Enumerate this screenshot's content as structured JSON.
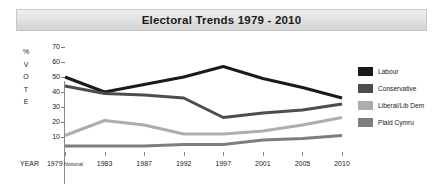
{
  "header": {
    "title": "Electoral Trends 1979 - 2010"
  },
  "axes": {
    "y_axis_caption_chars": [
      "%",
      "V",
      "O",
      "T",
      "E"
    ],
    "y_ticks": [
      70,
      60,
      50,
      40,
      30,
      20,
      10
    ],
    "x_axis_caption": "YEAR"
  },
  "legend": {
    "items": [
      {
        "label": "Labour",
        "color": "#1a1a1a"
      },
      {
        "label": "Conservative",
        "color": "#4d4d4d"
      },
      {
        "label": "Liberal/Lib Dem",
        "color": "#adadad"
      },
      {
        "label": "Plaid Cymru",
        "color": "#7d7d7d"
      }
    ]
  },
  "chart_data": {
    "type": "line",
    "title": "Electoral Trends 1979 - 2010",
    "xlabel": "YEAR",
    "ylabel": "% VOTE",
    "ylim": [
      0,
      70
    ],
    "grid": false,
    "legend_position": "right",
    "categories": [
      "1979 Notional",
      "1983",
      "1987",
      "1992",
      "1997",
      "2001",
      "2005",
      "2010"
    ],
    "x_tick_labels": [
      {
        "year": "1979",
        "note": "Notional"
      },
      {
        "year": "1983",
        "note": ""
      },
      {
        "year": "1987",
        "note": ""
      },
      {
        "year": "1992",
        "note": ""
      },
      {
        "year": "1997",
        "note": ""
      },
      {
        "year": "2001",
        "note": ""
      },
      {
        "year": "2005",
        "note": ""
      },
      {
        "year": "2010",
        "note": ""
      }
    ],
    "series": [
      {
        "name": "Labour",
        "color": "#1a1a1a",
        "values": [
          50,
          40,
          45,
          50,
          57,
          49,
          43,
          36
        ]
      },
      {
        "name": "Conservative",
        "color": "#4d4d4d",
        "values": [
          44,
          39,
          38,
          36,
          23,
          26,
          28,
          32
        ]
      },
      {
        "name": "Liberal/Lib Dem",
        "color": "#adadad",
        "values": [
          11,
          21,
          18,
          12,
          12,
          14,
          18,
          23
        ]
      },
      {
        "name": "Plaid Cymru",
        "color": "#7d7d7d",
        "values": [
          4,
          4,
          4,
          5,
          5,
          8,
          9,
          11
        ]
      }
    ]
  }
}
